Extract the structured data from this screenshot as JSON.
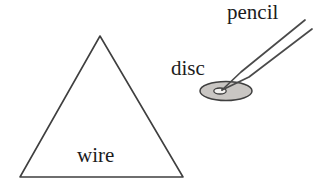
{
  "figure": {
    "width": 326,
    "height": 183,
    "background_color": "#ffffff",
    "stroke_color": "#3a3a3a",
    "disc_fill_color": "#c9c6c3",
    "disc_hole_color": "#f2f1ef",
    "labels": {
      "wire": "wire",
      "disc": "disc",
      "pencil": "pencil"
    },
    "shapes": {
      "triangle": {
        "name": "wire-triangle",
        "apex": [
          100,
          36
        ],
        "bottom_left": [
          20,
          177
        ],
        "bottom_right": [
          183,
          177
        ]
      },
      "disc": {
        "name": "disc-ellipse",
        "center": [
          226,
          91
        ],
        "rx": 26,
        "ry": 9.5,
        "hole_center": [
          220,
          91
        ],
        "hole_rx": 6,
        "hole_ry": 3
      },
      "pencil": {
        "name": "pencil-body",
        "tip": [
          222,
          90
        ],
        "upper_end": [
          305,
          20
        ],
        "lower_end": [
          312,
          29
        ]
      }
    }
  }
}
